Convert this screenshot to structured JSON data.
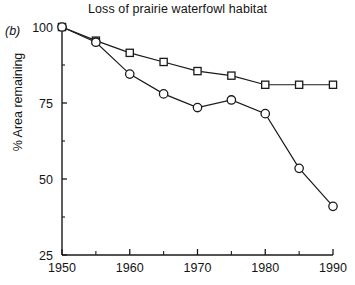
{
  "figure": {
    "panel_label": "(b)",
    "title": "Loss of prairie waterfowl habitat"
  },
  "axes": {
    "y_title": "% Area remaining",
    "y_ticks": [
      "25",
      "50",
      "75",
      "100"
    ],
    "x_ticks": [
      "1950",
      "1960",
      "1970",
      "1980",
      "1990"
    ]
  },
  "colors": {
    "line": "#1a1a1a",
    "marker_fill": "#ffffff",
    "axis": "#1a1a1a",
    "background": "#ffffff"
  },
  "chart_data": {
    "type": "line",
    "title": "Loss of prairie waterfowl habitat",
    "xlabel": "",
    "ylabel": "% Area remaining",
    "xlim": [
      1950,
      1990
    ],
    "ylim": [
      25,
      100
    ],
    "grid": false,
    "legend": "none",
    "x": [
      1950,
      1955,
      1960,
      1965,
      1970,
      1975,
      1980,
      1985,
      1990
    ],
    "x_major_ticks": [
      1950,
      1960,
      1970,
      1980,
      1990
    ],
    "x_minor_ticks": [
      1955,
      1965,
      1975,
      1985
    ],
    "y_major_ticks": [
      25,
      50,
      75,
      100
    ],
    "y_minor_ticks": [
      37.5,
      62.5,
      87.5
    ],
    "series": [
      {
        "name": "upper",
        "marker": "square",
        "values": [
          100,
          95.5,
          91.5,
          88.5,
          85.5,
          84,
          81,
          81,
          81
        ]
      },
      {
        "name": "lower",
        "marker": "circle",
        "values": [
          100,
          95,
          84.5,
          78,
          73.5,
          76,
          71.5,
          53.5,
          41
        ]
      }
    ]
  }
}
